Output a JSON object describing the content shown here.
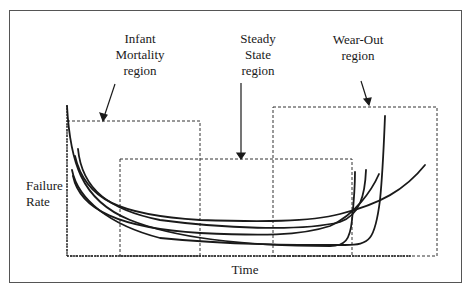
{
  "diagram": {
    "title": "",
    "type": "bathtub failure-rate curves",
    "regions": [
      {
        "label_line1": "Infant",
        "label_line2": "Mortality",
        "label_line3": "region"
      },
      {
        "label_line1": "Steady",
        "label_line2": "State",
        "label_line3": "region"
      },
      {
        "label_line1": "Wear-Out",
        "label_line2": "region"
      }
    ],
    "y_axis": {
      "label_line1": "Failure",
      "label_line2": "Rate"
    },
    "x_axis": {
      "label": "Time"
    },
    "curve_count": 5,
    "line_color": "#1a1a1a",
    "box_style": "dashed"
  }
}
